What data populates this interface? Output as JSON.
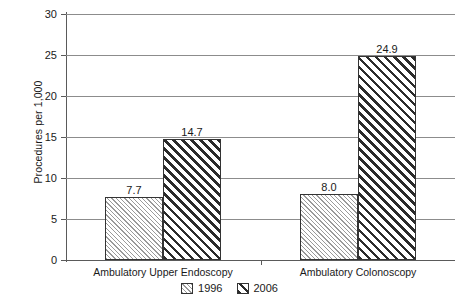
{
  "chart_data": {
    "type": "bar",
    "title": "",
    "subtitle": "",
    "xlabel": "",
    "ylabel": "Procedures per 1,000",
    "ylim": [
      0,
      30
    ],
    "yticks": [
      0,
      5,
      10,
      15,
      20,
      25,
      30
    ],
    "ytick_labels": [
      "0",
      "5",
      "10",
      "15",
      "20",
      "25",
      "30"
    ],
    "grid": true,
    "legend_position": "bottom-center",
    "categories": [
      "Ambulatory Upper Endoscopy",
      "Ambulatory Colonoscopy"
    ],
    "series": [
      {
        "name": "1996",
        "values": [
          7.7,
          8.0
        ],
        "labels": [
          "7.7",
          "8.0"
        ],
        "pattern": "light-diagonal-hatch",
        "color": "#9a9a9a"
      },
      {
        "name": "2006",
        "values": [
          14.7,
          24.9
        ],
        "labels": [
          "14.7",
          "24.9"
        ],
        "pattern": "bold-diagonal-hatch",
        "color": "#2b2b2b"
      }
    ]
  },
  "legend": {
    "items": [
      {
        "label": "1996",
        "swatch": "light-hatch-swatch"
      },
      {
        "label": "2006",
        "swatch": "bold-hatch-swatch"
      }
    ]
  },
  "colors": {
    "background": "#ffffff",
    "gridline": "#8c8c8c",
    "axis": "#5a5a5a",
    "bar_outline": "#333333",
    "text": "#1a1a1a"
  }
}
